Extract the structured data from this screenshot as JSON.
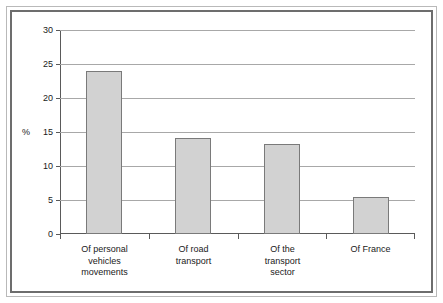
{
  "chart_data": {
    "type": "bar",
    "title": "",
    "subtitle": "",
    "xlabel": "",
    "ylabel": "%",
    "categories": [
      "Of personal\nvehicles\nmovements",
      "Of road\ntransport",
      "Of the\ntransport\nsector",
      "Of France"
    ],
    "values": [
      24.0,
      14.1,
      13.3,
      5.5
    ],
    "ylim": [
      0,
      30
    ],
    "ytick_labels": [
      "0",
      "5",
      "10",
      "15",
      "20",
      "25",
      "30"
    ],
    "ytick_values": [
      0,
      5,
      10,
      15,
      20,
      25,
      30
    ],
    "grid": true,
    "legend": false,
    "legend_position": "none",
    "bar_fill_color": "#d2d2d2",
    "bar_border_color": "#7a7a7a",
    "gridline_color": "#a8a8a8",
    "axis_color": "#5a5a5a",
    "background_color": "#ffffff"
  }
}
